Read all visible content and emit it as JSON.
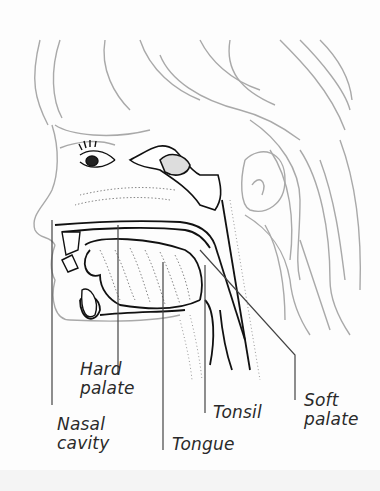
{
  "figure": {
    "labels": [
      {
        "id": "hard-palate",
        "lines": [
          "Hard",
          "palate"
        ]
      },
      {
        "id": "nasal-cavity",
        "lines": [
          "Nasal",
          "cavity"
        ]
      },
      {
        "id": "tongue",
        "lines": [
          "Tongue"
        ]
      },
      {
        "id": "tonsil",
        "lines": [
          "Tonsil"
        ]
      },
      {
        "id": "soft-palate",
        "lines": [
          "Soft",
          "palate"
        ]
      }
    ]
  }
}
